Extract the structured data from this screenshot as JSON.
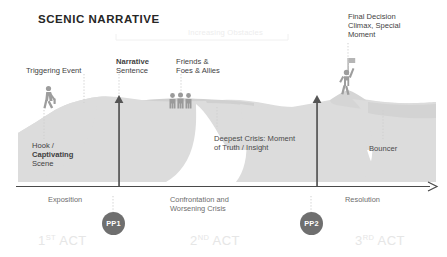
{
  "title": "SCENIC NARRATIVE",
  "colors": {
    "terrain": "#dcdcdc",
    "terrain_shade": "#d2d2d2",
    "figure": "#9a9a9a",
    "axis": "#4a4a4a",
    "arrow": "#555555",
    "pp_circle": "#6f6f6f",
    "text": "#3f3f3f",
    "faint_text": "#ededed",
    "act_text": "#e6e6e6",
    "leader_line": "#c9c9c9"
  },
  "annotations": {
    "triggering_event": "Triggering Event",
    "narrative_bold": "Narrative",
    "narrative_rest": "Sentence",
    "friends_line1": "Friends &",
    "friends_line2": "Foes & Allies",
    "final_line1": "Final Decision",
    "final_line2": "Climax, Special",
    "final_line3": "Moment",
    "hook_line1": "Hook /",
    "hook_line2": "Captivating",
    "hook_line3": "Scene",
    "crisis_line1": "Deepest Crisis: Moment",
    "crisis_line2": "of Truth / Insight",
    "bouncer": "Bouncer",
    "increasing_obstacles": "Increasing Obstacles"
  },
  "axis": {
    "phases": [
      {
        "label": "Exposition"
      },
      {
        "label_line1": "Confrontation and",
        "label_line2": "Worsening Crisis"
      },
      {
        "label": "Resolution"
      }
    ],
    "exposition": "Exposition",
    "confrontation_line1": "Confrontation and",
    "confrontation_line2": "Worsening Crisis",
    "resolution": "Resolution"
  },
  "plot_points": [
    {
      "label": "PP1"
    },
    {
      "label": "PP2"
    }
  ],
  "acts": [
    {
      "num": "1",
      "ord": "ST",
      "word": "ACT"
    },
    {
      "num": "2",
      "ord": "ND",
      "word": "ACT"
    },
    {
      "num": "3",
      "ord": "RD",
      "word": "ACT"
    }
  ],
  "icons": {
    "walking_person": "walking-person-icon",
    "group_people": "group-of-people-icon",
    "flag_person": "person-with-flag-icon",
    "arrow_up_1": "arrow-up-icon",
    "arrow_up_2": "arrow-up-icon",
    "axis_arrow": "axis-arrow-right-icon"
  }
}
